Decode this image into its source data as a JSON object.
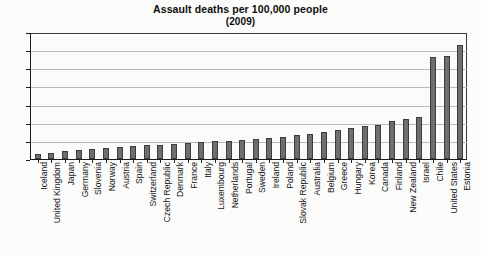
{
  "chart": {
    "title_line1": "Assault deaths per 100,000 people",
    "title_line2": "(2009)"
  },
  "chart_data": {
    "type": "bar",
    "title": "Assault deaths per 100,000 people (2009)",
    "xlabel": "",
    "ylabel": "",
    "ylim": [
      0,
      7
    ],
    "yticks": [
      0,
      1,
      2,
      3,
      4,
      5,
      6,
      7
    ],
    "ytick_labels": [
      "0",
      "1",
      "2",
      "3",
      "4",
      "5",
      "6",
      "7"
    ],
    "grid": true,
    "legend": "none",
    "bar_color": "#6e6e6e",
    "categories": [
      "Iceland",
      "United Kingdom",
      "Japan",
      "Germany",
      "Slovenia",
      "Norway",
      "Austria",
      "Spain",
      "Switzerland",
      "Czech Republic",
      "Denmark",
      "France",
      "Italy",
      "Luxembourg",
      "Netherlands",
      "Portugal",
      "Sweden",
      "Ireland",
      "Poland",
      "Slovak Republic",
      "Australia",
      "Belgium",
      "Greece",
      "Hungary",
      "Korea",
      "Canada",
      "Finland",
      "New Zealand",
      "Israel",
      "Chile",
      "United States",
      "Estonia"
    ],
    "values": [
      0.3,
      0.35,
      0.45,
      0.5,
      0.55,
      0.6,
      0.65,
      0.7,
      0.75,
      0.8,
      0.85,
      0.9,
      0.95,
      1.0,
      1.0,
      1.05,
      1.1,
      1.15,
      1.2,
      1.35,
      1.4,
      1.5,
      1.6,
      1.7,
      1.8,
      1.9,
      2.1,
      2.2,
      2.3,
      5.6,
      5.7,
      6.3
    ]
  }
}
